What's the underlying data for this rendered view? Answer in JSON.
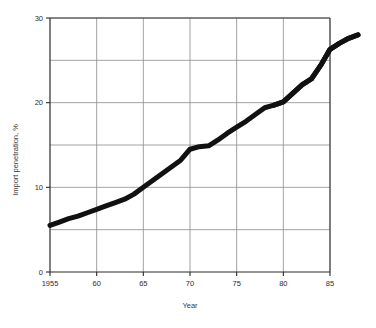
{
  "chart_data": {
    "type": "line",
    "title": "",
    "xlabel": "Year",
    "ylabel": "Import penetration, %",
    "xlim": [
      1955,
      1988
    ],
    "ylim": [
      0,
      30
    ],
    "grid": true,
    "legend_position": "none",
    "x_ticks": [
      {
        "value": 1955,
        "label": "1955"
      },
      {
        "value": 1960,
        "label": "60"
      },
      {
        "value": 1965,
        "label": "65"
      },
      {
        "value": 1970,
        "label": "70"
      },
      {
        "value": 1975,
        "label": "75"
      },
      {
        "value": 1980,
        "label": "80"
      },
      {
        "value": 1985,
        "label": "85"
      }
    ],
    "y_ticks": [
      {
        "value": 0,
        "label": "0"
      },
      {
        "value": 10,
        "label": "10"
      },
      {
        "value": 20,
        "label": "20"
      },
      {
        "value": 30,
        "label": "30"
      }
    ],
    "y_gridlines": [
      5,
      10,
      15,
      20,
      25,
      30
    ],
    "x_gridlines": [
      1960,
      1965,
      1970,
      1975,
      1980,
      1985
    ],
    "series": [
      {
        "name": "Import penetration",
        "x": [
          1955,
          1956,
          1957,
          1958,
          1959,
          1960,
          1961,
          1962,
          1963,
          1964,
          1965,
          1966,
          1967,
          1968,
          1969,
          1970,
          1971,
          1972,
          1973,
          1974,
          1975,
          1976,
          1977,
          1978,
          1979,
          1980,
          1981,
          1982,
          1983,
          1984,
          1985,
          1986,
          1987,
          1988
        ],
        "values": [
          5.5,
          5.9,
          6.3,
          6.6,
          7.0,
          7.4,
          7.8,
          8.2,
          8.6,
          9.2,
          10.0,
          10.8,
          11.6,
          12.4,
          13.2,
          14.5,
          14.8,
          14.9,
          15.6,
          16.4,
          17.1,
          17.8,
          18.6,
          19.4,
          19.7,
          20.1,
          21.1,
          22.1,
          22.8,
          24.4,
          26.3,
          27.0,
          27.6,
          28.0
        ]
      }
    ],
    "annotations": [
      {
        "text": "plateau near 15% between 1970 and 1972"
      },
      {
        "text": "plateau near 19.7% between 1978 and 1979"
      },
      {
        "text": "curve continues past the 1985 frame edge to about 28%"
      }
    ],
    "style": {
      "line_color": "#111111",
      "grid_color": "#8c8c8c",
      "frame_color": "#3a3a3a",
      "background": "#ffffff"
    }
  }
}
